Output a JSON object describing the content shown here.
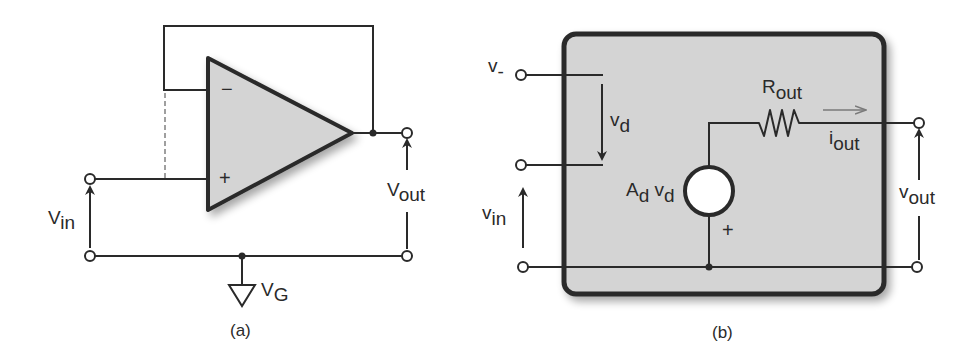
{
  "figure": {
    "panel_a": {
      "caption": "(a)",
      "opamp": {
        "minus_sign": "−",
        "plus_sign": "+"
      },
      "labels": {
        "vin": {
          "main": "V",
          "sub": "in"
        },
        "vout": {
          "main": "V",
          "sub": "out"
        },
        "vg": {
          "main": "V",
          "sub": "G"
        }
      }
    },
    "panel_b": {
      "caption": "(b)",
      "labels": {
        "vminus": {
          "main": "v",
          "sub": "-"
        },
        "vd": {
          "main": "v",
          "sub": "d"
        },
        "vin": {
          "main": "v",
          "sub": "in"
        },
        "source": {
          "main1": "A",
          "sub1": "d",
          "main2": " v",
          "sub2": "d"
        },
        "source_plus": "+",
        "rout": {
          "main": "R",
          "sub": "out"
        },
        "iout": {
          "main": "i",
          "sub": "out"
        },
        "vout": {
          "main": "v",
          "sub": "out"
        }
      }
    },
    "colors": {
      "line": "#2a2a2a",
      "fill_gray": "#d4d4d4",
      "current_arrow": "#7a7a7a",
      "background": "#ffffff"
    }
  }
}
